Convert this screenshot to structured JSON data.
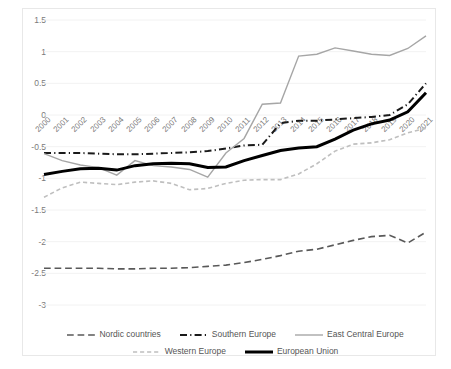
{
  "chart_data": {
    "type": "line",
    "title": "",
    "subtitle": "",
    "xlabel": "",
    "ylabel": "",
    "x": [
      2000,
      2001,
      2002,
      2003,
      2004,
      2005,
      2006,
      2007,
      2008,
      2009,
      2010,
      2011,
      2012,
      2013,
      2014,
      2015,
      2016,
      2017,
      2018,
      2019,
      2020,
      2021
    ],
    "xtick_labels": [
      "2000",
      "2001",
      "2002",
      "2003",
      "2004",
      "2005",
      "2006",
      "2007",
      "2008",
      "2009",
      "2010",
      "2011",
      "2012",
      "2013",
      "2014",
      "2015",
      "2016",
      "2017",
      "2018",
      "2019",
      "2020",
      "2021"
    ],
    "ytick_labels": [
      "1.5",
      "1",
      "0.5",
      "0",
      "-0.5",
      "-1",
      "-1.5",
      "-2",
      "-2.5",
      "-3"
    ],
    "ytick_values": [
      1.5,
      1,
      0.5,
      0,
      -0.5,
      -1,
      -1.5,
      -2,
      -2.5,
      -3
    ],
    "ylim": [
      -3.0,
      1.5
    ],
    "xlim": [
      2000,
      2021
    ],
    "grid": true,
    "legend_position": "bottom",
    "series": [
      {
        "name": "Nordic countries",
        "color": "#595959",
        "style": "long-dash",
        "width": 1.6,
        "values": [
          -2.42,
          -2.42,
          -2.42,
          -2.42,
          -2.43,
          -2.43,
          -2.42,
          -2.42,
          -2.41,
          -2.39,
          -2.37,
          -2.33,
          -2.28,
          -2.22,
          -2.15,
          -2.12,
          -2.05,
          -1.98,
          -1.92,
          -1.9,
          -2.02,
          -1.85
        ]
      },
      {
        "name": "Southern Europe",
        "color": "#1a1a1a",
        "style": "dash-dot",
        "width": 2.0,
        "values": [
          -0.6,
          -0.6,
          -0.6,
          -0.61,
          -0.62,
          -0.62,
          -0.61,
          -0.6,
          -0.59,
          -0.57,
          -0.53,
          -0.48,
          -0.47,
          -0.13,
          -0.09,
          -0.09,
          -0.07,
          -0.05,
          -0.03,
          0.0,
          0.17,
          0.5
        ]
      },
      {
        "name": "East Central Europe",
        "color": "#a6a6a6",
        "style": "solid",
        "width": 1.4,
        "values": [
          -0.61,
          -0.72,
          -0.79,
          -0.83,
          -0.95,
          -0.72,
          -0.8,
          -0.82,
          -0.86,
          -0.98,
          -0.6,
          -0.37,
          0.17,
          0.19,
          0.93,
          0.96,
          1.06,
          1.01,
          0.96,
          0.94,
          1.05,
          1.25
        ]
      },
      {
        "name": "Western Europe",
        "color": "#bfbfbf",
        "style": "short-dash",
        "width": 1.6,
        "values": [
          -1.3,
          -1.15,
          -1.06,
          -1.08,
          -1.1,
          -1.06,
          -1.04,
          -1.08,
          -1.18,
          -1.16,
          -1.08,
          -1.03,
          -1.02,
          -1.02,
          -0.93,
          -0.77,
          -0.57,
          -0.46,
          -0.44,
          -0.39,
          -0.28,
          -0.21
        ]
      },
      {
        "name": "European Union",
        "color": "#000000",
        "style": "solid",
        "width": 3.0,
        "values": [
          -0.94,
          -0.89,
          -0.85,
          -0.84,
          -0.87,
          -0.8,
          -0.77,
          -0.76,
          -0.77,
          -0.83,
          -0.82,
          -0.72,
          -0.64,
          -0.56,
          -0.52,
          -0.5,
          -0.38,
          -0.24,
          -0.14,
          -0.08,
          0.05,
          0.35
        ]
      }
    ]
  },
  "legend": {
    "rows": [
      [
        "Nordic countries",
        "Southern Europe",
        "East Central Europe"
      ],
      [
        "Western Europe",
        "European Union"
      ]
    ]
  }
}
